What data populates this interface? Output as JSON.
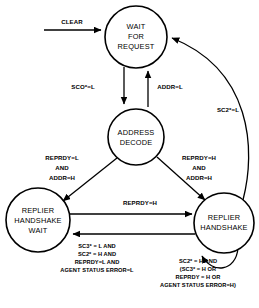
{
  "diagram": {
    "type": "state-transition-diagram",
    "states": [
      {
        "id": "wait-for-request",
        "line1": "WAIT",
        "line2": "FOR",
        "line3": "REQUEST",
        "cx": 136,
        "cy": 37,
        "r": 31
      },
      {
        "id": "address-decode",
        "line1": "ADDRESS",
        "line2": "DECODE",
        "line3": "",
        "cx": 136,
        "cy": 137,
        "r": 28
      },
      {
        "id": "replier-handshake-wait",
        "line1": "REPLIER",
        "line2": "HANDSHAKE",
        "line3": "WAIT",
        "cx": 38,
        "cy": 220,
        "r": 32
      },
      {
        "id": "replier-handshake",
        "line1": "REPLIER",
        "line2": "HANDSHAKE",
        "line3": "",
        "cx": 224,
        "cy": 223,
        "r": 30
      }
    ],
    "transitions": [
      {
        "id": "clear-input",
        "label": "CLEAR",
        "from": "external",
        "to": "wait-for-request"
      },
      {
        "id": "wait-to-decode",
        "label": "SCO*=L",
        "from": "wait-for-request",
        "to": "address-decode"
      },
      {
        "id": "decode-to-wait",
        "label": "ADDR=L",
        "from": "address-decode",
        "to": "wait-for-request"
      },
      {
        "id": "handshake-to-wait",
        "label": "SC2*=L",
        "from": "replier-handshake",
        "to": "wait-for-request"
      },
      {
        "id": "decode-to-handshake-wait",
        "label_line1": "REPRDY=L",
        "label_line2": "AND",
        "label_line3": "ADDR=H",
        "from": "address-decode",
        "to": "replier-handshake-wait"
      },
      {
        "id": "decode-to-handshake",
        "label_line1": "REPRDY=H",
        "label_line2": "AND",
        "label_line3": "ADDR=H",
        "from": "address-decode",
        "to": "replier-handshake"
      },
      {
        "id": "wait-to-handshake",
        "label": "REPRDY=H",
        "from": "replier-handshake-wait",
        "to": "replier-handshake"
      },
      {
        "id": "handshake-to-handshake-wait",
        "label_line1": "SC3* = L AND",
        "label_line2": "SC2* = H AND",
        "label_line3": "REPRDY=L AND",
        "label_line4": "AGENT STATUS ERROR=L",
        "from": "replier-handshake",
        "to": "replier-handshake-wait"
      },
      {
        "id": "handshake-self-loop",
        "label_line1": "SC2* = H AND",
        "label_line2": "(SC3* = H OR",
        "label_line3": "REPRDY = H OR",
        "label_line4": "AGENT STATUS ERROR=H)",
        "from": "replier-handshake",
        "to": "replier-handshake"
      }
    ],
    "colors": {
      "stroke": "#000000",
      "fill": "#ffffff",
      "text": "#000000"
    }
  }
}
